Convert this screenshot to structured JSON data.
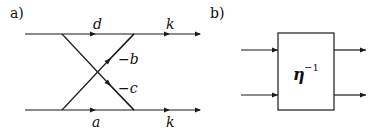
{
  "panel_a": {
    "label": "a)",
    "top_left_label": "d",
    "top_right_label": "k",
    "bottom_left_label": "a",
    "bottom_right_label": "k",
    "diag_upper_label": "−b",
    "diag_lower_label": "−c"
  },
  "panel_b": {
    "label": "b)",
    "box_symbol": "η",
    "box_superscript": "−1"
  }
}
